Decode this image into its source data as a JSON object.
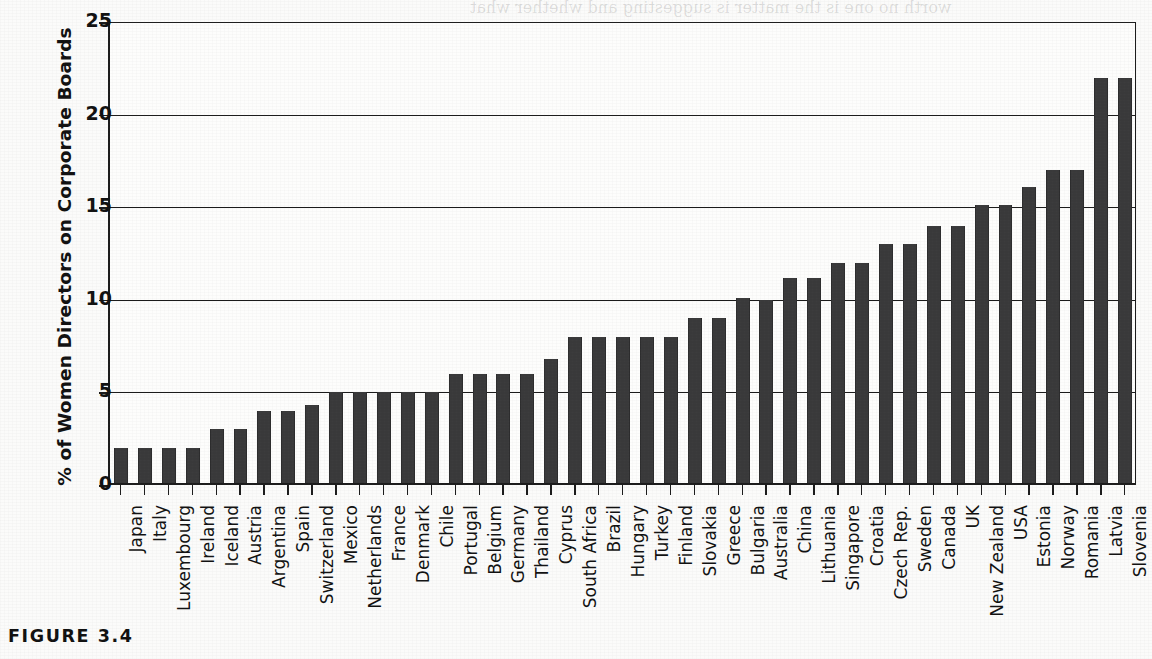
{
  "figure": {
    "caption": "FIGURE 3.4"
  },
  "chart_data": {
    "type": "bar",
    "title": "",
    "xlabel": "",
    "ylabel": "% of Women Directors on Corporate Boards",
    "ylim": [
      0,
      25
    ],
    "yticks": [
      0,
      5,
      10,
      15,
      20,
      25
    ],
    "ytick_labels": [
      "0",
      "5",
      "10",
      "15",
      "20",
      "25"
    ],
    "grid": true,
    "legend": "none",
    "categories": [
      "Japan",
      "Italy",
      "Luxembourg",
      "Ireland",
      "Iceland",
      "Austria",
      "Argentina",
      "Spain",
      "Switzerland",
      "Mexico",
      "Netherlands",
      "France",
      "Denmark",
      "Chile",
      "Portugal",
      "Belgium",
      "Germany",
      "Thailand",
      "Cyprus",
      "South Africa",
      "Brazil",
      "Hungary",
      "Turkey",
      "Finland",
      "Slovakia",
      "Greece",
      "Bulgaria",
      "Australia",
      "China",
      "Lithuania",
      "Singapore",
      "Croatia",
      "Czech Rep.",
      "Sweden",
      "Canada",
      "UK",
      "New Zealand",
      "USA",
      "Estonia",
      "Norway",
      "Romania",
      "Latvia",
      "Slovenia"
    ],
    "values": [
      2,
      2,
      2,
      2,
      3,
      3,
      4,
      4,
      4.3,
      5,
      5,
      5,
      5,
      5,
      6,
      6,
      6,
      6,
      6.8,
      8,
      8,
      8,
      8,
      8,
      9,
      9,
      10.1,
      10,
      11.2,
      11.2,
      12,
      12,
      13,
      13,
      14,
      14,
      15.1,
      15.1,
      16.1,
      17,
      17,
      22,
      22
    ]
  },
  "bleed_text": {
    "line1": "worth no one is the matter is suggesting and whether what",
    "line2": "board, because it is unlikely that officers and unions will allow the wishes of",
    "line3": "or Labyrinth: Which Better Describes",
    "line4": "omen in the Workplace?",
    "line5": "prospects. They could easily devote to the",
    "line6": "manage only a minority in the board"
  }
}
